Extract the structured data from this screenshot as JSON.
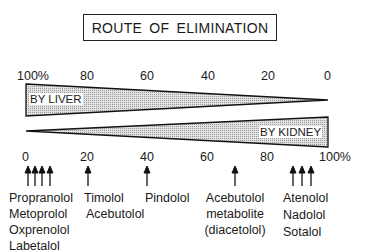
{
  "title": "ROUTE OF ELIMINATION",
  "top_axis": {
    "ticks": [
      "100%",
      "80",
      "60",
      "40",
      "20",
      "0"
    ]
  },
  "bottom_axis": {
    "ticks": [
      "0",
      "20",
      "40",
      "60",
      "80",
      "100%"
    ]
  },
  "bands": {
    "liver": {
      "label": "BY LIVER"
    },
    "kidney": {
      "label": "BY KIDNEY"
    }
  },
  "drugs": [
    {
      "group": "liver-dominant",
      "kidney_percent": [
        0,
        3,
        6,
        9
      ],
      "names": [
        "Propranolol",
        "Metoprolol",
        "Oxprenolol",
        "Labetalol"
      ]
    },
    {
      "group": "timolol",
      "kidney_percent": [
        20
      ],
      "names": [
        "Timolol",
        "Acebutolol"
      ]
    },
    {
      "group": "pindolol",
      "kidney_percent": [
        40
      ],
      "names": [
        "Pindolol"
      ]
    },
    {
      "group": "acebutolol-metabolite",
      "kidney_percent": [
        69
      ],
      "names": [
        "Acebutolol",
        "metabolite",
        "(diacetolol)"
      ]
    },
    {
      "group": "kidney-dominant",
      "kidney_percent": [
        88,
        91,
        94
      ],
      "names": [
        "Atenolol",
        "Nadolol",
        "Sotalol"
      ]
    }
  ],
  "colors": {
    "fill": "#d4d4d4",
    "stroke": "#111111",
    "text": "#1a1a1a"
  }
}
